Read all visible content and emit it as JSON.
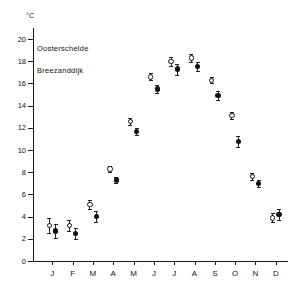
{
  "chart_data": {
    "type": "scatter",
    "title": "",
    "subtitle": "",
    "xlabel": "",
    "ylabel": "",
    "unit_label": "°C",
    "grid": false,
    "legend_position": "upper-left-inside",
    "categories": [
      "J",
      "F",
      "M",
      "A",
      "M",
      "J",
      "J",
      "A",
      "S",
      "O",
      "N",
      "D"
    ],
    "category_names": [
      "January",
      "February",
      "March",
      "April",
      "May",
      "June",
      "July",
      "August",
      "September",
      "October",
      "November",
      "December"
    ],
    "ylim": [
      0,
      21
    ],
    "yticks": [
      0,
      2,
      4,
      6,
      8,
      10,
      12,
      14,
      16,
      18,
      20
    ],
    "ytick_labels": [
      "0",
      "2",
      "4",
      "6",
      "8",
      "10",
      "12",
      "14",
      "16",
      "18",
      "20"
    ],
    "series": [
      {
        "name": "Oosterschelde",
        "marker": "open-circle",
        "color": "#111111",
        "values": [
          3.2,
          3.2,
          5.1,
          8.3,
          12.6,
          16.6,
          18.0,
          18.3,
          16.3,
          13.1,
          7.6,
          3.9
        ],
        "errors": [
          0.7,
          0.5,
          0.4,
          0.3,
          0.3,
          0.3,
          0.4,
          0.4,
          0.3,
          0.3,
          0.3,
          0.4
        ]
      },
      {
        "name": "Breezanddijk",
        "marker": "filled-circle",
        "color": "#111111",
        "values": [
          2.7,
          2.5,
          4.0,
          7.3,
          11.7,
          15.5,
          17.3,
          17.5,
          14.9,
          10.8,
          7.0,
          4.2
        ],
        "errors": [
          0.6,
          0.5,
          0.5,
          0.3,
          0.3,
          0.4,
          0.5,
          0.4,
          0.4,
          0.5,
          0.3,
          0.5
        ]
      }
    ]
  },
  "legend": {
    "entry_1": "Oosterschelde",
    "entry_2": "Breezanddijk"
  },
  "axis": {
    "unit": "°C"
  }
}
